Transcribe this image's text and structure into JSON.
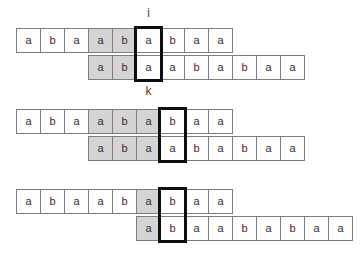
{
  "colors": {
    "background": "#ffffff",
    "cell_fill": "#fdfdfd",
    "shaded_fill": "#d4d4d4",
    "cell_border": "#7d7d7d",
    "highlight_border": "#0d0d0d",
    "letter_color": "#2e2e2e",
    "label_color": "#3c3c3c"
  },
  "groups": [
    {
      "top_label": "i",
      "bottom_label": "k",
      "top_row": {
        "offset": 0,
        "letters": [
          "a",
          "b",
          "a",
          "a",
          "b",
          "a",
          "b",
          "a",
          "a"
        ],
        "shaded": [
          3,
          4
        ],
        "highlight": 5
      },
      "bottom_row": {
        "offset": 3,
        "letters": [
          "a",
          "b",
          "a",
          "a",
          "b",
          "a",
          "b",
          "a",
          "a"
        ],
        "shaded": [
          0,
          1
        ],
        "highlight": 2
      }
    },
    {
      "top_label": "",
      "bottom_label": "",
      "top_row": {
        "offset": 0,
        "letters": [
          "a",
          "b",
          "a",
          "a",
          "b",
          "a",
          "b",
          "a",
          "a"
        ],
        "shaded": [
          3,
          4,
          5
        ],
        "highlight": 6
      },
      "bottom_row": {
        "offset": 3,
        "letters": [
          "a",
          "b",
          "a",
          "a",
          "b",
          "a",
          "b",
          "a",
          "a"
        ],
        "shaded": [
          0,
          1,
          2
        ],
        "highlight": 3
      }
    },
    {
      "top_label": "",
      "bottom_label": "",
      "top_row": {
        "offset": 0,
        "letters": [
          "a",
          "b",
          "a",
          "a",
          "b",
          "a",
          "b",
          "a",
          "a"
        ],
        "shaded": [
          5
        ],
        "highlight": 6
      },
      "bottom_row": {
        "offset": 5,
        "letters": [
          "a",
          "b",
          "a",
          "a",
          "b",
          "a",
          "b",
          "a",
          "a"
        ],
        "shaded": [
          0
        ],
        "highlight": 1
      }
    }
  ]
}
